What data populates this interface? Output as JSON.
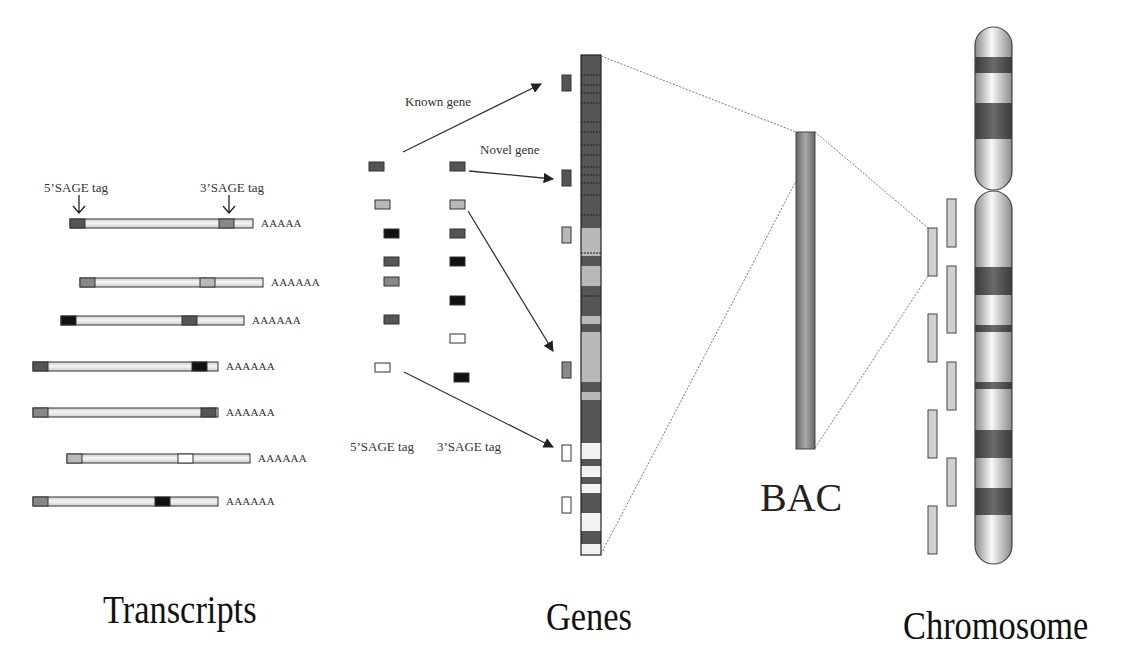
{
  "diagram": {
    "title_labels": {
      "transcripts": "Transcripts",
      "genes": "Genes",
      "chromosome": "Chromosome",
      "bac": "BAC"
    },
    "annotations": {
      "five_sage_top": "5’SAGE tag",
      "three_sage_top": "3’SAGE tag",
      "known_gene": "Known gene",
      "novel_gene": "Novel gene",
      "five_sage_bottom": "5’SAGE tag",
      "three_sage_bottom": "3’SAGE tag"
    },
    "colors": {
      "dark": "#555555",
      "mid": "#888888",
      "light": "#b8b8b8",
      "black": "#111111",
      "white": "#ffffff",
      "tube": "#e8e8e8",
      "outline": "#333333"
    },
    "transcripts": [
      {
        "x": 70,
        "y": 219,
        "w": 183,
        "tag5": "dark",
        "tag3x": 219,
        "tag3": "mid",
        "polyA": "AAAAA"
      },
      {
        "x": 80,
        "y": 278,
        "w": 183,
        "tag5": "mid",
        "tag3x": 200,
        "tag3": "light",
        "polyA": "AAAAAA"
      },
      {
        "x": 61,
        "y": 316,
        "w": 183,
        "tag5": "black",
        "tag3x": 182,
        "tag3": "dark",
        "polyA": "AAAAAA"
      },
      {
        "x": 33,
        "y": 362,
        "w": 185,
        "tag5": "dark",
        "tag3x": 192,
        "tag3": "black",
        "polyA": "AAAAAA"
      },
      {
        "x": 33,
        "y": 408,
        "w": 185,
        "tag5": "mid",
        "tag3x": 201,
        "tag3": "dark",
        "polyA": "AAAAAA"
      },
      {
        "x": 67,
        "y": 454,
        "w": 183,
        "tag5": "light",
        "tag3x": 178,
        "tag3": "white",
        "polyA": "AAAAAA"
      },
      {
        "x": 33,
        "y": 497,
        "w": 185,
        "tag5": "mid",
        "tag3x": 155,
        "tag3": "black",
        "polyA": "AAAAAA"
      }
    ],
    "sage_tags_5": [
      {
        "x": 369,
        "y": 162,
        "c": "dark"
      },
      {
        "x": 375,
        "y": 200,
        "c": "light"
      },
      {
        "x": 384,
        "y": 229,
        "c": "black"
      },
      {
        "x": 384,
        "y": 257,
        "c": "dark"
      },
      {
        "x": 384,
        "y": 277,
        "c": "mid"
      },
      {
        "x": 384,
        "y": 315,
        "c": "dark"
      },
      {
        "x": 375,
        "y": 363,
        "c": "white"
      }
    ],
    "sage_tags_3": [
      {
        "x": 450,
        "y": 162,
        "c": "dark"
      },
      {
        "x": 450,
        "y": 200,
        "c": "light"
      },
      {
        "x": 450,
        "y": 229,
        "c": "dark"
      },
      {
        "x": 450,
        "y": 257,
        "c": "black"
      },
      {
        "x": 450,
        "y": 296,
        "c": "black"
      },
      {
        "x": 450,
        "y": 334,
        "c": "white"
      },
      {
        "x": 454,
        "y": 373,
        "c": "black"
      }
    ],
    "gene_markers": [
      {
        "x": 562,
        "y": 75,
        "h": 16,
        "c": "dark"
      },
      {
        "x": 562,
        "y": 170,
        "h": 16,
        "c": "dark"
      },
      {
        "x": 562,
        "y": 227,
        "h": 16,
        "c": "light"
      },
      {
        "x": 562,
        "y": 362,
        "h": 16,
        "c": "mid"
      },
      {
        "x": 562,
        "y": 445,
        "h": 16,
        "c": "white"
      },
      {
        "x": 562,
        "y": 497,
        "h": 16,
        "c": "white"
      }
    ],
    "gene_column": {
      "x": 581,
      "y": 55,
      "w": 20,
      "h": 500,
      "bands": [
        {
          "y": 55,
          "h": 173,
          "c": "dark"
        },
        {
          "y": 228,
          "h": 28,
          "c": "light"
        },
        {
          "y": 256,
          "h": 10,
          "c": "dark"
        },
        {
          "y": 266,
          "h": 20,
          "c": "light"
        },
        {
          "y": 286,
          "h": 30,
          "c": "dark"
        },
        {
          "y": 316,
          "h": 8,
          "c": "light"
        },
        {
          "y": 324,
          "h": 8,
          "c": "dark"
        },
        {
          "y": 332,
          "h": 50,
          "c": "light"
        },
        {
          "y": 382,
          "h": 10,
          "c": "dark"
        },
        {
          "y": 392,
          "h": 8,
          "c": "light"
        },
        {
          "y": 400,
          "h": 43,
          "c": "dark"
        },
        {
          "y": 443,
          "h": 16,
          "c": "white"
        },
        {
          "y": 459,
          "h": 7,
          "c": "dark"
        },
        {
          "y": 466,
          "h": 11,
          "c": "white"
        },
        {
          "y": 477,
          "h": 7,
          "c": "dark"
        },
        {
          "y": 484,
          "h": 9,
          "c": "white"
        },
        {
          "y": 493,
          "h": 20,
          "c": "dark"
        },
        {
          "y": 513,
          "h": 18,
          "c": "white"
        },
        {
          "y": 531,
          "h": 13,
          "c": "dark"
        },
        {
          "y": 544,
          "h": 11,
          "c": "white"
        }
      ],
      "lines_y": [
        75,
        85,
        93,
        103,
        122,
        132,
        145,
        155,
        167,
        175,
        183,
        195,
        215,
        253,
        296
      ]
    },
    "bac": {
      "x": 796,
      "y": 132,
      "w": 19,
      "h": 317
    },
    "clones_left": [
      {
        "x": 928,
        "y": 228
      },
      {
        "x": 928,
        "y": 314
      },
      {
        "x": 928,
        "y": 410
      },
      {
        "x": 928,
        "y": 506
      }
    ],
    "clones_right": [
      {
        "x": 947,
        "y": 199,
        "h": 48
      },
      {
        "x": 947,
        "y": 266,
        "h": 67
      },
      {
        "x": 947,
        "y": 362,
        "h": 48
      },
      {
        "x": 947,
        "y": 458,
        "h": 48
      }
    ],
    "chromosome": {
      "x": 975,
      "w": 37,
      "p_arm": {
        "y": 27,
        "h": 163
      },
      "q_arm": {
        "y": 191,
        "h": 373
      },
      "bands": [
        {
          "y": 57,
          "h": 16,
          "c": "dark"
        },
        {
          "y": 103,
          "h": 36,
          "c": "dark"
        },
        {
          "y": 267,
          "h": 28,
          "c": "dark"
        },
        {
          "y": 325,
          "h": 7,
          "c": "dark"
        },
        {
          "y": 382,
          "h": 7,
          "c": "dark"
        },
        {
          "y": 430,
          "h": 28,
          "c": "dark"
        },
        {
          "y": 488,
          "h": 27,
          "c": "dark"
        }
      ]
    }
  }
}
